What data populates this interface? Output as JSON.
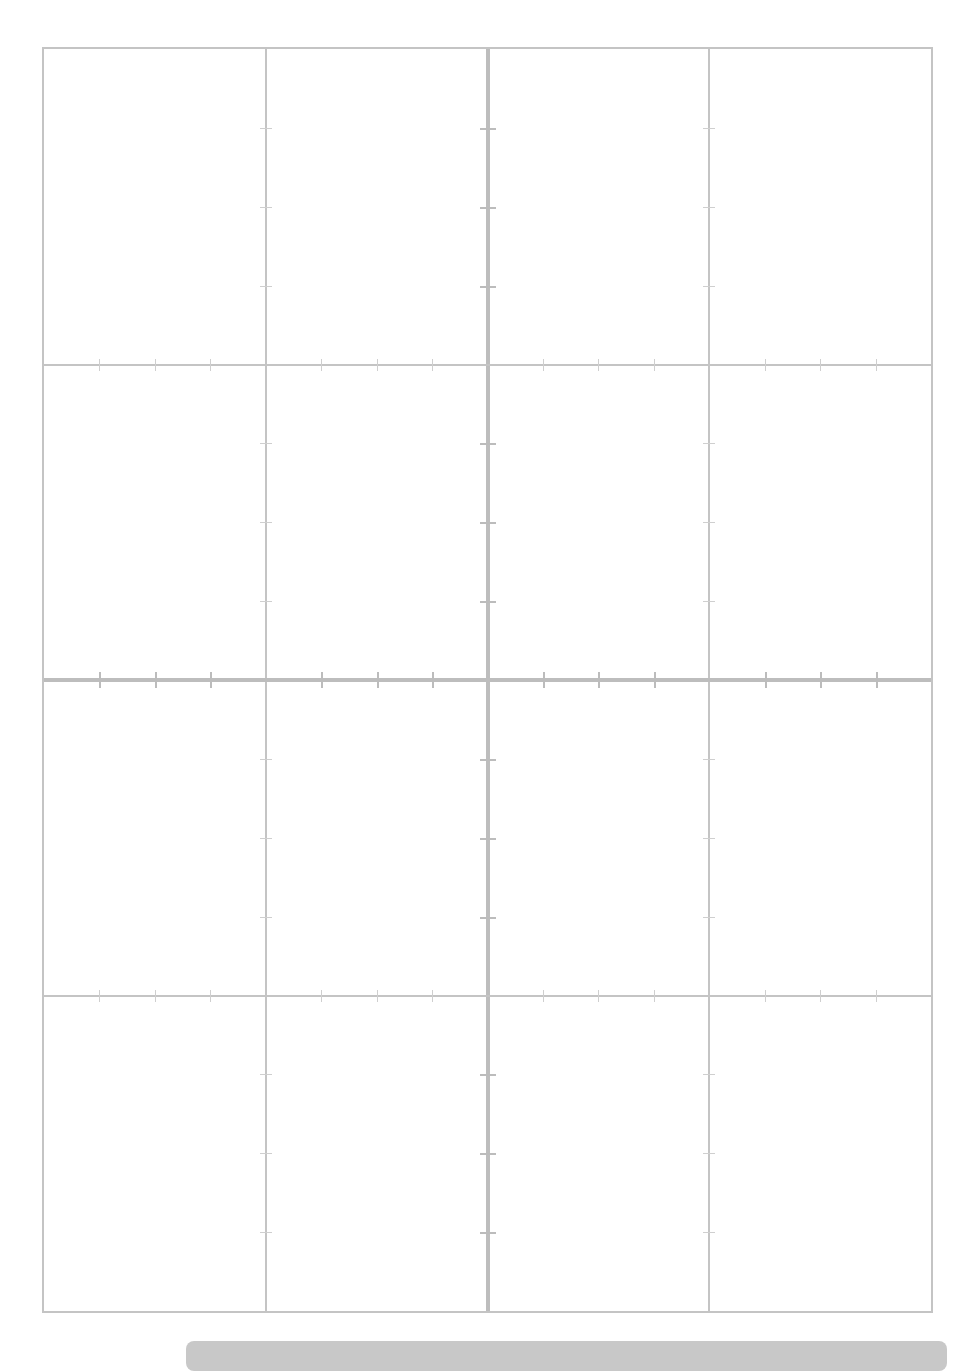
{
  "page": {
    "corner_mark": "",
    "grid": {
      "columns": 4,
      "rows": 4,
      "line_color": "#c4c4c4",
      "thick_line_color": "#bdbdbd",
      "ticks_per_segment": 3
    },
    "bottom_bar": {
      "color": "#c8c8c8",
      "label": ""
    }
  }
}
